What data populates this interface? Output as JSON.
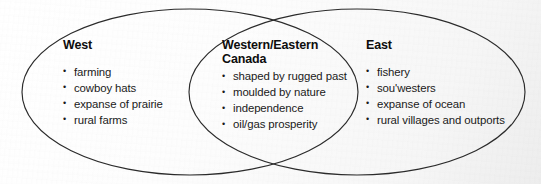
{
  "diagram": {
    "type": "venn",
    "title": "",
    "stroke_color": "#2b2b2b",
    "background_color": "#fbfbfb",
    "text_color": "#111111",
    "bullet_glyph": "•",
    "regions": [
      {
        "id": "west",
        "heading": "West",
        "items": [
          "farming",
          "cowboy hats",
          "expanse of prairie",
          "rural farms"
        ]
      },
      {
        "id": "overlap",
        "heading_line1": "Western/Eastern",
        "heading_line2": "Canada",
        "items": [
          "shaped by rugged past",
          "moulded by nature",
          "independence",
          "oil/gas prosperity"
        ]
      },
      {
        "id": "east",
        "heading": "East",
        "items": [
          "fishery",
          "sou'westers",
          "expanse of ocean",
          "rural villages and outports"
        ]
      }
    ]
  }
}
